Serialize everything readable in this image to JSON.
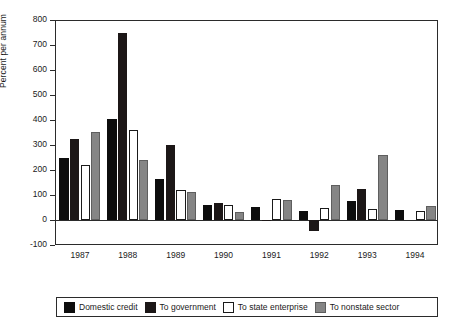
{
  "chart_data": {
    "type": "bar",
    "title": "",
    "subtitle": "",
    "xlabel": "",
    "ylabel": "Percent per annum",
    "categories": [
      "1987",
      "1988",
      "1989",
      "1990",
      "1991",
      "1992",
      "1993",
      "1994"
    ],
    "ylim": [
      -100,
      800
    ],
    "yticks": [
      -100,
      0,
      100,
      200,
      300,
      400,
      500,
      600,
      700,
      800
    ],
    "ytick_labels": [
      "-100",
      "0",
      "100",
      "200",
      "300",
      "400",
      "500",
      "600",
      "700",
      "800"
    ],
    "grid": false,
    "legend_position": "bottom",
    "series": [
      {
        "name": "Domestic credit",
        "color": "#0d0d0d",
        "values": [
          250,
          403,
          165,
          60,
          52,
          38,
          78,
          40
        ]
      },
      {
        "name": "To government",
        "color": "#1c1717",
        "values": [
          325,
          747,
          300,
          68,
          -5,
          -45,
          125,
          0
        ]
      },
      {
        "name": "To state enterprise",
        "color": "#ffffff",
        "values": [
          222,
          362,
          120,
          60,
          86,
          50,
          45,
          37
        ]
      },
      {
        "name": "To nonstate sector",
        "color": "#858585",
        "values": [
          353,
          240,
          113,
          32,
          80,
          140,
          260,
          58
        ]
      }
    ]
  },
  "legend": {
    "items": [
      {
        "label": "Domestic credit",
        "swatch": "#0d0d0d"
      },
      {
        "label": "To government",
        "swatch": "#1c1717"
      },
      {
        "label": "To state enterprise",
        "swatch": "#ffffff"
      },
      {
        "label": "To nonstate sector",
        "swatch": "#858585"
      }
    ]
  }
}
